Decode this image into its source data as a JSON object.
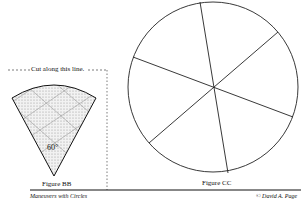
{
  "cut_label": "Cut along this line.",
  "angle_label": "60°",
  "figure_bb": "Figure BB",
  "figure_cc": "Figure CC",
  "footer_left": "Maneuvers with Circles",
  "footer_right": "© David A. Page"
}
